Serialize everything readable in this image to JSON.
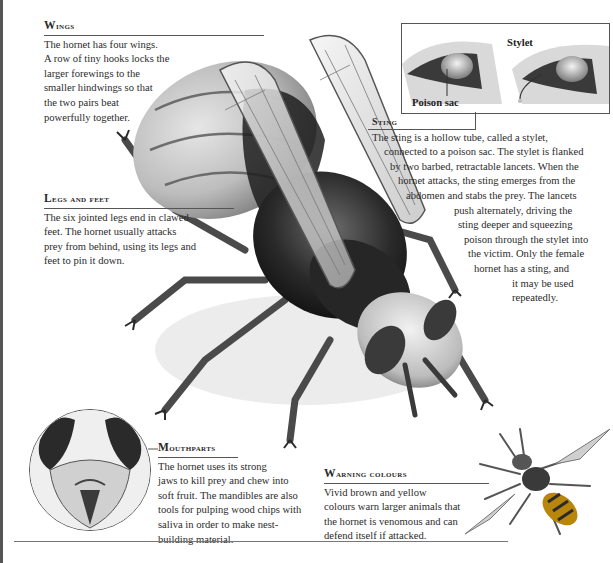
{
  "wings": {
    "heading": "Wings",
    "lines": [
      "The hornet has four wings.",
      "A row of tiny hooks locks the",
      "larger forewings to the",
      "smaller hindwings so that",
      "the two pairs beat",
      "powerfully together."
    ]
  },
  "legs": {
    "heading": "Legs and feet",
    "lines": [
      "The six jointed legs end in clawed",
      "feet. The hornet usually attacks",
      "prey from behind, using its legs and",
      "feet to pin it down."
    ]
  },
  "inset": {
    "label_poison_sac": "Poison sac",
    "label_stylet": "Stylet"
  },
  "sting": {
    "heading": "Sting",
    "lines": [
      "The sting is a hollow tube, called a stylet,",
      "connected to a poison sac. The stylet is flanked",
      "by two barbed, retractable lancets. When the",
      "hornet attacks, the sting emerges from the",
      "abdomen and stabs the prey. The lancets",
      "push alternately, driving the",
      "sting deeper and squeezing",
      "poison through the stylet into",
      "the victim. Only the female",
      "hornet has a sting, and",
      "it may be used",
      "repeatedly."
    ]
  },
  "mouthparts": {
    "heading": "Mouthparts",
    "lines": [
      "The hornet uses its strong",
      "jaws to kill prey and chew into",
      "soft fruit. The mandibles are also",
      "tools for pulping wood chips with",
      "saliva in order to make nest-",
      "building material."
    ]
  },
  "warning": {
    "heading": "Warning colours",
    "lines": [
      "Vivid brown and yellow",
      "colours warn larger animals that",
      "the hornet is venomous and can",
      "defend itself if attacked."
    ]
  },
  "colors": {
    "text": "#2b2b2b",
    "rule": "#555555",
    "ink_dark": "#1e1e1e",
    "ink_mid": "#6a6a6a",
    "wing": "#d8d8d8"
  }
}
